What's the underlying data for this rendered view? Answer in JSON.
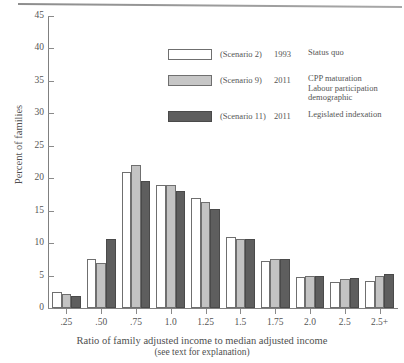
{
  "chart_data": {
    "type": "bar",
    "title": "",
    "xlabel": "Ratio of family adjusted income to median adjusted income",
    "xlabel_note": "(see text for explanation)",
    "ylabel": "Percent of families",
    "ylim": [
      0,
      45
    ],
    "ytick_step": 5,
    "yticks": [
      "45",
      "40",
      "35",
      "30",
      "25",
      "20",
      "15",
      "10",
      "5",
      "0"
    ],
    "grid": false,
    "legend_position": "upper-center",
    "categories": [
      ".25",
      ".50",
      ".75",
      "1.0",
      "1.25",
      "1.5",
      "1.75",
      "2.0",
      "2.5",
      "2.5+"
    ],
    "series": [
      {
        "name": "Scenario 2",
        "year": "1993",
        "description": "Status quo",
        "color": "#ffffff",
        "values": [
          2.5,
          7.6,
          21.0,
          19.0,
          17.0,
          11.0,
          7.3,
          4.8,
          4.0,
          4.1
        ]
      },
      {
        "name": "Scenario 9",
        "year": "2011",
        "description": "CPP maturation Labour participation demographic",
        "description_lines": [
          "CPP maturation",
          "Labour participation",
          "demographic"
        ],
        "color": "#c3c3c3",
        "values": [
          2.2,
          6.9,
          22.0,
          18.9,
          16.4,
          10.6,
          7.5,
          4.9,
          4.4,
          4.9
        ]
      },
      {
        "name": "Scenario 11",
        "year": "2011",
        "description": "Legislated indexation",
        "color": "#5e5e5e",
        "values": [
          1.9,
          10.7,
          19.6,
          18.0,
          15.2,
          10.6,
          7.6,
          5.0,
          4.7,
          5.2
        ]
      }
    ]
  },
  "legend": {
    "rows": [
      {
        "scenario": "(Scenario 2)",
        "year": "1993",
        "desc_lines": [
          "Status quo"
        ]
      },
      {
        "scenario": "(Scenario 9)",
        "year": "2011",
        "desc_lines": [
          "CPP maturation",
          "Labour participation",
          "demographic"
        ]
      },
      {
        "scenario": "(Scenario 11)",
        "year": "2011",
        "desc_lines": [
          "Legislated indexation"
        ]
      }
    ]
  },
  "axes": {
    "y_title": "Percent of families",
    "x_title": "Ratio of family adjusted income to median adjusted income",
    "x_subtitle": "(see text for explanation)"
  },
  "colors": {
    "series1": "#ffffff",
    "series2": "#c3c3c3",
    "series3": "#5e5e5e",
    "axis": "#808080",
    "text": "#4f4f4f"
  }
}
